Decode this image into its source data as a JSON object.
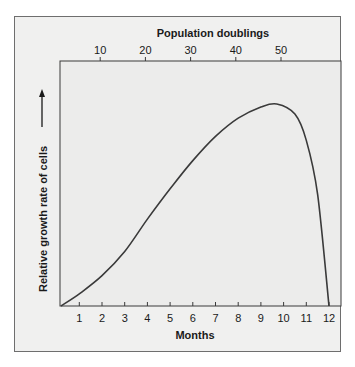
{
  "chart_data": {
    "type": "line",
    "title": "",
    "xlabel": "Months",
    "ylabel": "Relative growth rate of cells",
    "x2label": "Population doublings",
    "x_ticks": [
      1,
      2,
      3,
      4,
      5,
      6,
      7,
      8,
      9,
      10,
      11,
      12
    ],
    "x2_ticks": [
      10,
      20,
      30,
      40,
      50
    ],
    "xlim": [
      0,
      12.7
    ],
    "ylim": [
      0,
      1.1
    ],
    "grid": false,
    "legend": null,
    "series": [
      {
        "name": "Relative growth rate",
        "x": [
          0.2,
          1,
          2,
          3,
          4,
          5,
          6,
          7,
          8,
          9,
          9.7,
          10.5,
          11,
          11.5,
          12
        ],
        "values": [
          0,
          0.06,
          0.15,
          0.27,
          0.43,
          0.58,
          0.72,
          0.84,
          0.93,
          0.985,
          1.0,
          0.95,
          0.82,
          0.55,
          0
        ]
      }
    ],
    "annotations": [
      "upward arrow next to y-axis label"
    ]
  },
  "labels": {
    "top_axis_title": "Population doublings",
    "bottom_axis_title": "Months",
    "y_axis_title": "Relative growth rate of cells"
  },
  "colors": {
    "background": "#f0f0ef",
    "curve": "#3a3a3a",
    "axis": "#3a3a3a",
    "frame": "#6e6e6e"
  }
}
